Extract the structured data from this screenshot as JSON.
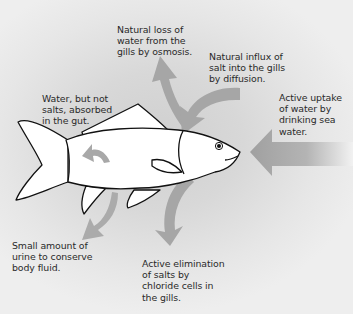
{
  "diagram": {
    "colors": {
      "background": "#d8d8d8",
      "arrow": "#a8a8a8",
      "fish_fill": "#ffffff",
      "fish_outline": "#111111",
      "text": "#2a2a2a"
    },
    "labels": {
      "water_loss": "Natural loss of\nwater from the\ngills by osmosis.",
      "salt_influx": "Natural influx of\nsalt into the gills\nby diffusion.",
      "drinking": "Active uptake\nof water by\ndrinking sea\nwater.",
      "gut": "Water, but not\nsalts, absorbed\nin the gut.",
      "urine": "Small amount of\nurine to conserve\nbody fluid.",
      "salt_elimination": "Active elimination\nof salts by\nchloride cells in\nthe gills."
    },
    "arrows": [
      {
        "id": "water-loss-arrow",
        "direction": "up-out-of-gills"
      },
      {
        "id": "salt-influx-arrow",
        "direction": "into-gills"
      },
      {
        "id": "drinking-arrow",
        "direction": "left-into-mouth"
      },
      {
        "id": "gut-arrow",
        "direction": "curved-left-inside-body"
      },
      {
        "id": "urine-arrow",
        "direction": "down-left"
      },
      {
        "id": "salt-elimination-arrow",
        "direction": "down-from-gills"
      }
    ]
  }
}
